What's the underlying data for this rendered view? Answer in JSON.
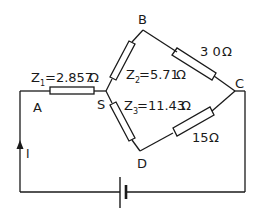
{
  "diagram": {
    "type": "circuit",
    "nodes": {
      "A": "A",
      "B": "B",
      "C": "C",
      "D": "D",
      "S": "S"
    },
    "resistors": {
      "z1": {
        "name": "Z",
        "sub": "1",
        "value": "=2.857",
        "unit": "Ω"
      },
      "z2": {
        "name": "Z",
        "sub": "2",
        "value": "=5.71",
        "unit": "Ω"
      },
      "z3": {
        "name": "Z",
        "sub": "3",
        "value": "=11.43",
        "unit": "Ω"
      },
      "bc": {
        "value": "3 0",
        "unit": "Ω"
      },
      "dc": {
        "value": "15",
        "unit": "Ω"
      }
    },
    "current_label": "I",
    "colors": {
      "ink": "#1a1a1a",
      "background": "#ffffff"
    }
  }
}
